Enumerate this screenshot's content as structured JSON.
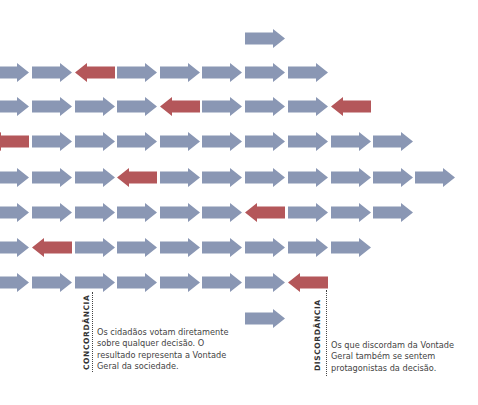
{
  "colors": {
    "agree_arrow": "#8a97b4",
    "disagree_arrow": "#b4575a",
    "text": "#444444",
    "label": "#333333"
  },
  "arrow_size": {
    "width": 40,
    "height": 19,
    "shaft_height": 12,
    "head_length": 12
  },
  "rows": [
    {
      "y": 29,
      "arrows": [
        {
          "x": 245,
          "dir": "right",
          "type": "agree"
        }
      ]
    },
    {
      "y": 63,
      "arrows": [
        {
          "x": -11,
          "dir": "right",
          "type": "agree"
        },
        {
          "x": 32,
          "dir": "right",
          "type": "agree"
        },
        {
          "x": 75,
          "dir": "left",
          "type": "disagree"
        },
        {
          "x": 117,
          "dir": "right",
          "type": "agree"
        },
        {
          "x": 160,
          "dir": "right",
          "type": "agree"
        },
        {
          "x": 202,
          "dir": "right",
          "type": "agree"
        },
        {
          "x": 245,
          "dir": "right",
          "type": "agree"
        },
        {
          "x": 288,
          "dir": "right",
          "type": "agree"
        }
      ]
    },
    {
      "y": 97,
      "arrows": [
        {
          "x": -11,
          "dir": "right",
          "type": "agree"
        },
        {
          "x": 32,
          "dir": "right",
          "type": "agree"
        },
        {
          "x": 75,
          "dir": "right",
          "type": "agree"
        },
        {
          "x": 117,
          "dir": "right",
          "type": "agree"
        },
        {
          "x": 160,
          "dir": "left",
          "type": "disagree"
        },
        {
          "x": 202,
          "dir": "right",
          "type": "agree"
        },
        {
          "x": 245,
          "dir": "right",
          "type": "agree"
        },
        {
          "x": 288,
          "dir": "right",
          "type": "agree"
        },
        {
          "x": 331,
          "dir": "left",
          "type": "disagree"
        }
      ]
    },
    {
      "y": 132,
      "arrows": [
        {
          "x": -11,
          "dir": "left",
          "type": "disagree"
        },
        {
          "x": 32,
          "dir": "right",
          "type": "agree"
        },
        {
          "x": 75,
          "dir": "right",
          "type": "agree"
        },
        {
          "x": 117,
          "dir": "right",
          "type": "agree"
        },
        {
          "x": 160,
          "dir": "right",
          "type": "agree"
        },
        {
          "x": 202,
          "dir": "right",
          "type": "agree"
        },
        {
          "x": 245,
          "dir": "right",
          "type": "agree"
        },
        {
          "x": 288,
          "dir": "right",
          "type": "agree"
        },
        {
          "x": 331,
          "dir": "right",
          "type": "agree"
        },
        {
          "x": 373,
          "dir": "right",
          "type": "agree"
        }
      ]
    },
    {
      "y": 168,
      "arrows": [
        {
          "x": -11,
          "dir": "right",
          "type": "agree"
        },
        {
          "x": 32,
          "dir": "right",
          "type": "agree"
        },
        {
          "x": 75,
          "dir": "right",
          "type": "agree"
        },
        {
          "x": 117,
          "dir": "left",
          "type": "disagree"
        },
        {
          "x": 160,
          "dir": "right",
          "type": "agree"
        },
        {
          "x": 202,
          "dir": "right",
          "type": "agree"
        },
        {
          "x": 245,
          "dir": "right",
          "type": "agree"
        },
        {
          "x": 288,
          "dir": "right",
          "type": "agree"
        },
        {
          "x": 331,
          "dir": "right",
          "type": "agree"
        },
        {
          "x": 373,
          "dir": "right",
          "type": "agree"
        },
        {
          "x": 415,
          "dir": "right",
          "type": "agree"
        }
      ]
    },
    {
      "y": 203,
      "arrows": [
        {
          "x": -11,
          "dir": "right",
          "type": "agree"
        },
        {
          "x": 32,
          "dir": "right",
          "type": "agree"
        },
        {
          "x": 75,
          "dir": "right",
          "type": "agree"
        },
        {
          "x": 117,
          "dir": "right",
          "type": "agree"
        },
        {
          "x": 160,
          "dir": "right",
          "type": "agree"
        },
        {
          "x": 202,
          "dir": "right",
          "type": "agree"
        },
        {
          "x": 245,
          "dir": "left",
          "type": "disagree"
        },
        {
          "x": 288,
          "dir": "right",
          "type": "agree"
        },
        {
          "x": 331,
          "dir": "right",
          "type": "agree"
        },
        {
          "x": 373,
          "dir": "right",
          "type": "agree"
        }
      ]
    },
    {
      "y": 238,
      "arrows": [
        {
          "x": -11,
          "dir": "right",
          "type": "agree"
        },
        {
          "x": 32,
          "dir": "left",
          "type": "disagree"
        },
        {
          "x": 75,
          "dir": "right",
          "type": "agree"
        },
        {
          "x": 117,
          "dir": "right",
          "type": "agree"
        },
        {
          "x": 160,
          "dir": "right",
          "type": "agree"
        },
        {
          "x": 202,
          "dir": "right",
          "type": "agree"
        },
        {
          "x": 245,
          "dir": "right",
          "type": "agree"
        },
        {
          "x": 288,
          "dir": "right",
          "type": "agree"
        },
        {
          "x": 331,
          "dir": "right",
          "type": "agree"
        }
      ]
    },
    {
      "y": 273,
      "arrows": [
        {
          "x": -11,
          "dir": "right",
          "type": "agree"
        },
        {
          "x": 32,
          "dir": "right",
          "type": "agree"
        },
        {
          "x": 75,
          "dir": "right",
          "type": "agree"
        },
        {
          "x": 117,
          "dir": "right",
          "type": "agree"
        },
        {
          "x": 160,
          "dir": "right",
          "type": "agree"
        },
        {
          "x": 202,
          "dir": "right",
          "type": "agree"
        },
        {
          "x": 245,
          "dir": "right",
          "type": "agree"
        },
        {
          "x": 288,
          "dir": "left",
          "type": "disagree"
        }
      ]
    },
    {
      "y": 309,
      "arrows": [
        {
          "x": 245,
          "dir": "right",
          "type": "agree"
        }
      ]
    }
  ],
  "annotations": {
    "concordancia": {
      "label": "CONCORDÂNCIA",
      "lines": [
        "Os cidadãos votam diretamente",
        "sobre qualquer decisão. O",
        "resultado representa a Vontade",
        "Geral da sociedade."
      ]
    },
    "discordancia": {
      "label": "DISCORDÂNCIA",
      "lines": [
        "Os que discordam da Vontade",
        "Geral também se sentem",
        "protagonistas da decisão."
      ]
    }
  }
}
